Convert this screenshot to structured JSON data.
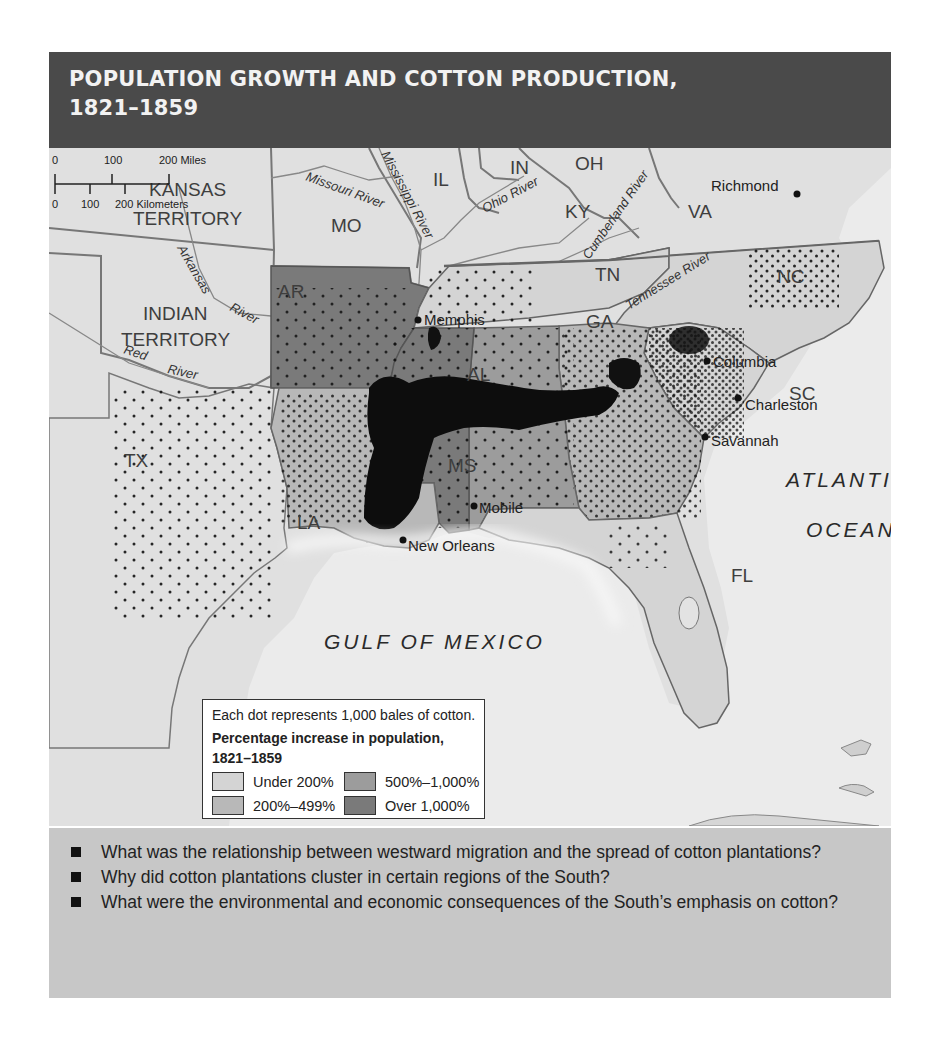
{
  "title": {
    "line1": "POPULATION GROWTH AND COTTON PRODUCTION,",
    "line2": "1821–1859"
  },
  "map": {
    "regions": [
      {
        "label": "KANSAS",
        "label2": "TERRITORY",
        "category": "none"
      },
      {
        "label": "INDIAN",
        "label2": "TERRITORY",
        "category": "none"
      },
      {
        "label": "MO",
        "category": "none"
      },
      {
        "label": "IL",
        "category": "none"
      },
      {
        "label": "IN",
        "category": "none"
      },
      {
        "label": "OH",
        "category": "none"
      },
      {
        "label": "KY",
        "category": "none"
      },
      {
        "label": "VA",
        "category": "none"
      },
      {
        "label": "TX",
        "category": "none"
      },
      {
        "label": "AR",
        "category": "Over 1,000%"
      },
      {
        "label": "TN",
        "category": "Under 200%"
      },
      {
        "label": "NC",
        "category": "Under 200%"
      },
      {
        "label": "SC",
        "category": "Under 200%"
      },
      {
        "label": "GA",
        "category": "200%–499%"
      },
      {
        "label": "AL",
        "category": "500%–1,000%"
      },
      {
        "label": "MS",
        "category": "Over 1,000%"
      },
      {
        "label": "LA",
        "category": "200%–499%"
      },
      {
        "label": "FL",
        "category": "Under 200%"
      }
    ],
    "rivers": [
      "Missouri River",
      "Mississippi River",
      "Ohio River",
      "Cumberland River",
      "Tennessee River",
      "Arkansas River",
      "Red River"
    ],
    "cities": [
      "Richmond",
      "Memphis",
      "Columbia",
      "Charleston",
      "Savannah",
      "Mobile",
      "New Orleans"
    ],
    "water_bodies": {
      "gulf": "GULF OF MEXICO",
      "atlantic_line1": "ATLANTIC",
      "atlantic_line2": "OCEAN"
    },
    "labels": {
      "kansas1": "KANSAS",
      "kansas2": "TERRITORY",
      "indian1": "INDIAN",
      "indian2": "TERRITORY",
      "mo": "MO",
      "il": "IL",
      "in": "IN",
      "oh": "OH",
      "ky": "KY",
      "va": "VA",
      "tx": "TX",
      "ar": "AR",
      "tn": "TN",
      "nc": "NC",
      "sc": "SC",
      "ga": "GA",
      "al": "AL",
      "ms": "MS",
      "la": "LA",
      "fl": "FL",
      "missouri_river": "Missouri River",
      "mississippi_river": "Mississippi River",
      "ohio_river": "Ohio River",
      "cumberland_river": "Cumberland River",
      "tennessee_river": "Tennessee River",
      "arkansas_river": "Arkansas",
      "arkansas_river2": "River",
      "red_river": "Red",
      "red_river2": "River",
      "richmond": "Richmond",
      "memphis": "Memphis",
      "columbia": "Columbia",
      "charleston": "Charleston",
      "savannah": "Savannah",
      "mobile": "Mobile",
      "new_orleans": "New Orleans"
    }
  },
  "legend": {
    "note": "Each dot represents 1,000 bales of cotton.",
    "heading": "Percentage increase in population, 1821–1859",
    "items": [
      {
        "label": "Under 200%",
        "color": "#d4d4d4"
      },
      {
        "label": "500%–1,000%",
        "color": "#9c9c9c"
      },
      {
        "label": "200%–499%",
        "color": "#b8b8b8"
      },
      {
        "label": "Over 1,000%",
        "color": "#7a7a7a"
      }
    ]
  },
  "scale": {
    "miles_0": "0",
    "miles_100": "100",
    "miles_200": "200 Miles",
    "km_0": "0",
    "km_100": "100",
    "km_200": "200 Kilometers"
  },
  "questions": [
    "What was the relationship between westward migration and the spread of cotton plantations?",
    "Why did cotton plantations cluster in certain regions of the South?",
    "What were the environmental and economic consequences of the South’s emphasis on cotton?"
  ],
  "colors": {
    "title_band": "#4a4a4a",
    "question_band": "#c7c7c7",
    "land_outside": "#e3e3e3",
    "water": "#ececec",
    "under_200": "#d4d4d4",
    "range_200_499": "#b8b8b8",
    "range_500_1000": "#9c9c9c",
    "over_1000": "#7a7a7a"
  }
}
